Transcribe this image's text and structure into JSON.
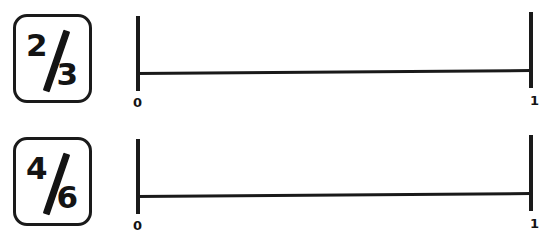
{
  "worksheet": {
    "title": "Equivalent fractions on number lines",
    "problems": [
      {
        "id": "problem-1",
        "fraction": {
          "numerator": "2",
          "denominator": "3",
          "display": "2/3"
        },
        "numberline": {
          "start_label": "0",
          "end_label": "1",
          "start_value": 0,
          "end_value": 1,
          "ticks": [
            "0",
            "1"
          ]
        }
      },
      {
        "id": "problem-2",
        "fraction": {
          "numerator": "4",
          "denominator": "6",
          "display": "4/6"
        },
        "numberline": {
          "start_label": "0",
          "end_label": "1",
          "start_value": 0,
          "end_value": 1,
          "ticks": [
            "0",
            "1"
          ]
        }
      }
    ]
  },
  "colors": {
    "ink": "#1a1a1a",
    "text": "#141414",
    "paper": "#ffffff"
  }
}
